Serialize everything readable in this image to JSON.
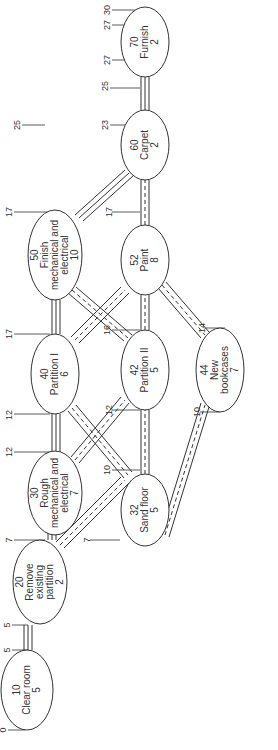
{
  "diagram": {
    "orientation": "rotated-90-ccw",
    "nodes": [
      {
        "id": "10",
        "name": "Clear room",
        "duration": "5",
        "cx": 27,
        "cy": 690,
        "rx": 26,
        "ry": 40,
        "lines": [
          "10",
          "Clear room",
          "5"
        ]
      },
      {
        "id": "20",
        "name": "Remove existing partition",
        "duration": "2",
        "cx": 40,
        "cy": 582,
        "rx": 27,
        "ry": 42,
        "lines": [
          "20",
          "Remove",
          "existing",
          "partition",
          "2"
        ]
      },
      {
        "id": "30",
        "name": "Rough mechanical and electrical",
        "duration": "7",
        "cx": 55,
        "cy": 493,
        "rx": 27,
        "ry": 42,
        "lines": [
          "30",
          "Rough",
          "mechanical and",
          "electrical",
          "7"
        ]
      },
      {
        "id": "32",
        "name": "Sand floor",
        "duration": "5",
        "cx": 145,
        "cy": 510,
        "rx": 24,
        "ry": 36,
        "lines": [
          "32",
          "Sand floor",
          "5"
        ]
      },
      {
        "id": "40",
        "name": "Partition I",
        "duration": "6",
        "cx": 55,
        "cy": 374,
        "rx": 24,
        "ry": 40,
        "lines": [
          "40",
          "Partition I",
          "6"
        ]
      },
      {
        "id": "42",
        "name": "Partition II",
        "duration": "5",
        "cx": 145,
        "cy": 370,
        "rx": 24,
        "ry": 40,
        "lines": [
          "42",
          "Partition II",
          "5"
        ]
      },
      {
        "id": "44",
        "name": "New bookcases",
        "duration": "7",
        "cx": 220,
        "cy": 370,
        "rx": 24,
        "ry": 42,
        "lines": [
          "44",
          "New",
          "bookcases",
          "7"
        ]
      },
      {
        "id": "50",
        "name": "Finish mechanical and electrical",
        "duration": "10",
        "cx": 55,
        "cy": 255,
        "rx": 27,
        "ry": 45,
        "lines": [
          "50",
          "Finish",
          "mechanical and",
          "electrical",
          "10"
        ]
      },
      {
        "id": "52",
        "name": "Paint",
        "duration": "8",
        "cx": 145,
        "cy": 260,
        "rx": 24,
        "ry": 35,
        "lines": [
          "52",
          "Paint",
          "8"
        ]
      },
      {
        "id": "60",
        "name": "Carpet",
        "duration": "2",
        "cx": 145,
        "cy": 145,
        "rx": 24,
        "ry": 35,
        "lines": [
          "60",
          "Carpet",
          "2"
        ]
      },
      {
        "id": "70",
        "name": "Furnish",
        "duration": "2",
        "cx": 145,
        "cy": 42,
        "rx": 24,
        "ry": 35,
        "lines": [
          "70",
          "Furnish",
          "2"
        ]
      }
    ],
    "time_marks": [
      {
        "label": "0",
        "x": 6,
        "y": 730
      },
      {
        "label": "5",
        "x": 10,
        "y": 650
      },
      {
        "label": "5",
        "x": 10,
        "y": 625
      },
      {
        "label": "7",
        "x": 12,
        "y": 540
      },
      {
        "label": "7",
        "x": 90,
        "y": 540
      },
      {
        "label": "12",
        "x": 12,
        "y": 452
      },
      {
        "label": "12",
        "x": 12,
        "y": 415
      },
      {
        "label": "10",
        "x": 110,
        "y": 470
      },
      {
        "label": "12",
        "x": 112,
        "y": 410
      },
      {
        "label": "17",
        "x": 12,
        "y": 334
      },
      {
        "label": "16",
        "x": 110,
        "y": 330
      },
      {
        "label": "10",
        "x": 200,
        "y": 412
      },
      {
        "label": "14",
        "x": 205,
        "y": 328
      },
      {
        "label": "17",
        "x": 12,
        "y": 212
      },
      {
        "label": "17",
        "x": 112,
        "y": 212
      },
      {
        "label": "25",
        "x": 20,
        "y": 125
      },
      {
        "label": "23",
        "x": 108,
        "y": 125
      },
      {
        "label": "25",
        "x": 108,
        "y": 86
      },
      {
        "label": "27",
        "x": 110,
        "y": 60
      },
      {
        "label": "27",
        "x": 110,
        "y": 25
      },
      {
        "label": "30",
        "x": 110,
        "y": 10
      }
    ],
    "float_annotations": [
      {
        "between": "32-42",
        "values": [
          "0",
          "3",
          "8",
          "2",
          "0",
          "2"
        ]
      },
      {
        "between": "42-52",
        "values": [
          "0",
          "1",
          "6",
          "1",
          "0",
          "1"
        ]
      },
      {
        "between": "52-60",
        "values": [
          "0",
          "3",
          "2",
          "0"
        ]
      },
      {
        "between": "30/40 cross",
        "values": [
          "8",
          "3",
          "0",
          "2",
          "2",
          "0",
          "12"
        ]
      },
      {
        "between": "40/50 cross",
        "values": [
          "6",
          "1",
          "0",
          "0",
          "1"
        ]
      },
      {
        "between": "52-44 cross",
        "values": [
          "2",
          "6",
          "2",
          "3",
          "0",
          "0",
          "2",
          "6"
        ]
      }
    ]
  }
}
